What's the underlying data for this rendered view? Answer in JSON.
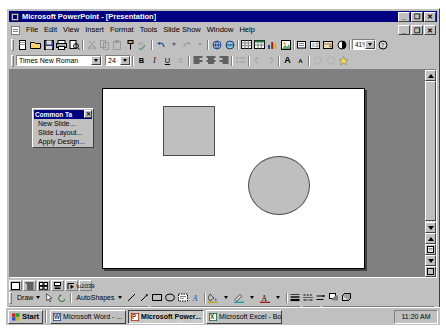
{
  "window": {
    "title": "Microsoft PowerPoint - [Presentation]",
    "app_icon": "powerpoint-icon",
    "minimize": "_",
    "maximize": "❐",
    "close": "✕",
    "doc_minimize": "_",
    "doc_restore": "❐",
    "doc_close": "✕"
  },
  "menu": {
    "items": [
      {
        "label": "File"
      },
      {
        "label": "Edit"
      },
      {
        "label": "View"
      },
      {
        "label": "Insert"
      },
      {
        "label": "Format"
      },
      {
        "label": "Tools"
      },
      {
        "label": "Slide Show"
      },
      {
        "label": "Window"
      },
      {
        "label": "Help"
      }
    ]
  },
  "standard_toolbar": {
    "buttons": [
      {
        "name": "new-icon",
        "glyph": "□"
      },
      {
        "name": "open-icon",
        "glyph": "📂"
      },
      {
        "name": "save-icon",
        "glyph": "💾"
      },
      {
        "name": "print-icon",
        "glyph": "🖨"
      },
      {
        "name": "print-preview-icon",
        "glyph": "⌕"
      },
      {
        "name": "spelling-icon",
        "glyph": "ABC"
      },
      {
        "name": "cut-icon",
        "glyph": "✂"
      },
      {
        "name": "copy-icon",
        "glyph": "⧉"
      },
      {
        "name": "paste-icon",
        "glyph": "📋"
      },
      {
        "name": "format-painter-icon",
        "glyph": "🖌"
      },
      {
        "name": "undo-icon",
        "glyph": "↶"
      },
      {
        "name": "redo-icon",
        "glyph": "↷"
      },
      {
        "name": "insert-hyperlink-icon",
        "glyph": "🔗"
      },
      {
        "name": "insert-table-icon",
        "glyph": "▦"
      },
      {
        "name": "insert-chart-icon",
        "glyph": "📊"
      },
      {
        "name": "insert-clipart-icon",
        "glyph": "✿"
      },
      {
        "name": "new-slide-icon",
        "glyph": "▭"
      },
      {
        "name": "slide-layout-icon",
        "glyph": "▤"
      },
      {
        "name": "apply-design-icon",
        "glyph": "▧"
      },
      {
        "name": "black-white-view-icon",
        "glyph": "◐"
      }
    ],
    "zoom_value": "41%",
    "help_icon": "office-assistant-icon"
  },
  "formatting_toolbar": {
    "font_name": "Times New Roman",
    "font_size": "24",
    "bold": "B",
    "italic": "I",
    "underline": "U",
    "shadow": "S",
    "align_left": "align-left-icon",
    "align_center": "align-center-icon",
    "align_right": "align-right-icon",
    "bullets": "bullets-icon",
    "increase_font": "A",
    "decrease_font": "A",
    "promote": "promote-icon",
    "demote": "demote-icon",
    "animation_effects": "animation-effects-icon"
  },
  "common_tasks": {
    "title": "Common Ta",
    "close": "✕",
    "items": [
      {
        "label": "New Slide..."
      },
      {
        "label": "Slide Layout..."
      },
      {
        "label": "Apply Design..."
      }
    ]
  },
  "slide": {
    "shapes": [
      {
        "name": "rectangle-shape",
        "type": "rectangle",
        "fill": "#bfbfbf",
        "stroke": "#4d4d4d"
      },
      {
        "name": "oval-shape",
        "type": "oval",
        "fill": "#bfbfbf",
        "stroke": "#4d4d4d"
      }
    ]
  },
  "view_bar": {
    "buttons": [
      {
        "name": "slide-view-button",
        "glyph": "□"
      },
      {
        "name": "outline-view-button",
        "glyph": "☰"
      },
      {
        "name": "slide-sorter-view-button",
        "glyph": "▦"
      },
      {
        "name": "notes-page-view-button",
        "glyph": "▤"
      },
      {
        "name": "slide-show-view-button",
        "glyph": "▷"
      }
    ]
  },
  "drawing_toolbar": {
    "draw_label": "Draw",
    "autoshapes_label": "AutoShapes",
    "buttons": [
      {
        "name": "select-objects-icon",
        "glyph": "↖"
      },
      {
        "name": "free-rotate-icon",
        "glyph": "↺"
      },
      {
        "name": "line-icon",
        "glyph": "╲"
      },
      {
        "name": "arrow-icon",
        "glyph": "↘"
      },
      {
        "name": "rectangle-icon",
        "glyph": "□"
      },
      {
        "name": "oval-icon",
        "glyph": "○"
      },
      {
        "name": "text-box-icon",
        "glyph": "▤"
      },
      {
        "name": "wordart-icon",
        "glyph": "Å"
      },
      {
        "name": "fill-color-icon",
        "glyph": "🖌"
      },
      {
        "name": "line-color-icon",
        "glyph": "✒"
      },
      {
        "name": "font-color-icon",
        "glyph": "A"
      },
      {
        "name": "line-style-icon",
        "glyph": "≡"
      },
      {
        "name": "dash-style-icon",
        "glyph": "┉"
      },
      {
        "name": "arrow-style-icon",
        "glyph": "⇨"
      },
      {
        "name": "shadow-icon",
        "glyph": "◧"
      },
      {
        "name": "3d-icon",
        "glyph": "◰"
      }
    ]
  },
  "status_bar": {
    "slide_indicator": "Slide 1 of 1",
    "design_name": "Default Design",
    "spelling_icon": "spelling-status-icon"
  },
  "taskbar": {
    "start_label": "Start",
    "buttons": [
      {
        "label": "Microsoft Word - ...",
        "icon": "word-icon",
        "active": false
      },
      {
        "label": "Microsoft Power...",
        "icon": "powerpoint-icon",
        "active": true
      },
      {
        "label": "Microsoft Excel - Bo...",
        "icon": "excel-icon",
        "active": false
      }
    ],
    "clock": "11:20 AM"
  },
  "colors": {
    "title_bar": "#000080",
    "face": "#c0c0c0",
    "workspace": "#808080",
    "slide": "#ffffff",
    "shape_fill": "#bfbfbf"
  }
}
